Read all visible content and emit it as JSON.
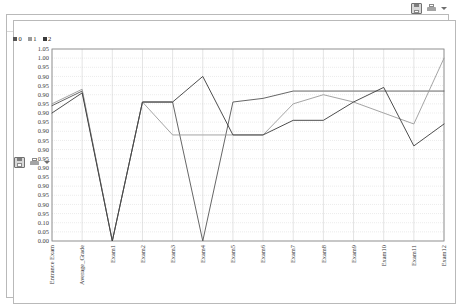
{
  "toolbar_top": {
    "icons": [
      {
        "name": "save-icon",
        "glyph": "save"
      },
      {
        "name": "print-icon",
        "glyph": "print"
      },
      {
        "name": "dropdown-caret-icon",
        "glyph": "caret"
      }
    ]
  },
  "toolbar_panel": {
    "icons": [
      {
        "name": "save-icon",
        "glyph": "save"
      },
      {
        "name": "print-icon",
        "glyph": "print"
      },
      {
        "name": "dropdown-caret-icon",
        "glyph": "caret"
      }
    ]
  },
  "view_selector": {
    "options": [
      {
        "label": "Text View",
        "selected": false
      },
      {
        "label": "Folder View",
        "selected": false
      },
      {
        "label": "Graph View",
        "selected": false
      },
      {
        "label": "Centroid Table",
        "selected": false
      },
      {
        "label": "Centroid Plot View",
        "selected": true
      },
      {
        "label": "Annotations",
        "selected": false
      }
    ]
  },
  "legend": {
    "items": [
      {
        "label": "0",
        "color": "#555555"
      },
      {
        "label": "1",
        "color": "#9a9a9a"
      },
      {
        "label": "2",
        "color": "#3a3a3a"
      }
    ]
  },
  "chart_data": {
    "type": "line",
    "title": "",
    "xlabel": "",
    "ylabel": "",
    "ylim": [
      0.0,
      1.05
    ],
    "grid": true,
    "legend_position": "top-left",
    "categories": [
      "Entrance Exam",
      "Average_Grade",
      "Exam1",
      "Exam2",
      "Exam3",
      "Exam4",
      "Exam5",
      "Exam6",
      "Exam7",
      "Exam8",
      "Exam9",
      "Exam10",
      "Exam11",
      "Exam12"
    ],
    "ytick_labels": [
      "1.05",
      "1.00",
      "0.95",
      "0.90",
      "0.95",
      "0.90",
      "0.95",
      "0.90",
      "0.95",
      "0.90",
      "0.95",
      "0.90",
      "0.95",
      "0.90",
      "0.95",
      "0.90",
      "0.95",
      "0.90",
      "0.95",
      "0.10",
      "0.05",
      "0.00"
    ],
    "series": [
      {
        "name": "0",
        "color": "#555555",
        "values": [
          0.74,
          0.82,
          0.0,
          0.76,
          0.76,
          0.0,
          0.76,
          0.78,
          0.82,
          0.82,
          0.82,
          0.82,
          0.82,
          0.82
        ]
      },
      {
        "name": "1",
        "color": "#9a9a9a",
        "values": [
          0.75,
          0.83,
          0.0,
          0.76,
          0.58,
          0.58,
          0.58,
          0.58,
          0.75,
          0.8,
          0.76,
          0.7,
          0.64,
          1.0
        ]
      },
      {
        "name": "2",
        "color": "#3a3a3a",
        "values": [
          0.7,
          0.81,
          0.0,
          0.76,
          0.76,
          0.9,
          0.58,
          0.58,
          0.66,
          0.66,
          0.76,
          0.84,
          0.52,
          0.64
        ]
      }
    ]
  }
}
